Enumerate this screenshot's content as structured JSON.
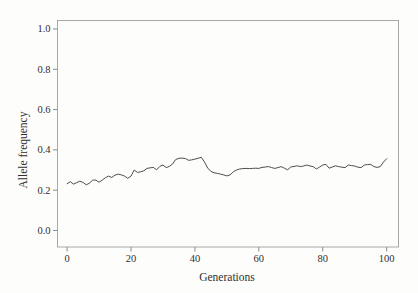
{
  "figure": {
    "background": "#fdfdfc",
    "box_border_color": "#a8a8a8",
    "tick_color": "#8a8a8a",
    "line_color": "#4d4d4d",
    "text_color": "#2f2f2f"
  },
  "chart_data": {
    "type": "line",
    "title": "",
    "xlabel": "Generations",
    "ylabel": "Allele frequency",
    "xlim": [
      -3,
      103.7
    ],
    "ylim": [
      -0.082,
      1.042
    ],
    "grid": false,
    "legend": null,
    "xticks": [
      0,
      20,
      40,
      60,
      80,
      100
    ],
    "xtick_labels": [
      "0",
      "20",
      "40",
      "60",
      "80",
      "100"
    ],
    "yticks": [
      0.0,
      0.2,
      0.4,
      0.6,
      0.8,
      1.0
    ],
    "ytick_labels": [
      "0.0",
      "0.2",
      "0.4",
      "0.6",
      "0.8",
      "1.0"
    ],
    "series": [
      {
        "name": "allele-frequency-trajectory",
        "x_start": 0,
        "x_step": 1,
        "values": [
          0.232,
          0.242,
          0.23,
          0.237,
          0.245,
          0.238,
          0.226,
          0.235,
          0.25,
          0.25,
          0.239,
          0.25,
          0.262,
          0.27,
          0.263,
          0.275,
          0.28,
          0.276,
          0.27,
          0.259,
          0.27,
          0.3,
          0.288,
          0.291,
          0.296,
          0.308,
          0.311,
          0.313,
          0.301,
          0.318,
          0.325,
          0.312,
          0.318,
          0.33,
          0.352,
          0.358,
          0.359,
          0.357,
          0.348,
          0.35,
          0.354,
          0.358,
          0.363,
          0.34,
          0.31,
          0.293,
          0.286,
          0.283,
          0.28,
          0.276,
          0.271,
          0.276,
          0.291,
          0.3,
          0.305,
          0.307,
          0.308,
          0.307,
          0.308,
          0.309,
          0.308,
          0.313,
          0.315,
          0.317,
          0.312,
          0.308,
          0.312,
          0.317,
          0.309,
          0.301,
          0.315,
          0.318,
          0.321,
          0.317,
          0.32,
          0.325,
          0.32,
          0.317,
          0.305,
          0.315,
          0.325,
          0.328,
          0.309,
          0.315,
          0.321,
          0.317,
          0.314,
          0.312,
          0.325,
          0.322,
          0.32,
          0.314,
          0.312,
          0.325,
          0.327,
          0.328,
          0.317,
          0.313,
          0.317,
          0.34,
          0.356
        ]
      }
    ]
  }
}
